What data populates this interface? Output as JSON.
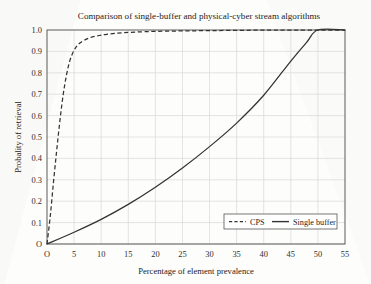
{
  "chart_data": {
    "type": "line",
    "title": "Comparison of single-buffer and physical-cyber stream algorithms",
    "xlabel": "Percentage of element prevalence",
    "ylabel": "Probality of retrieval",
    "xlim": [
      0,
      55
    ],
    "ylim": [
      0,
      1.0
    ],
    "grid": true,
    "legend_position": "lower right",
    "origin_label": "O",
    "xticks": [
      5,
      10,
      15,
      20,
      25,
      30,
      35,
      40,
      45,
      50,
      55
    ],
    "xticklabels": [
      "5",
      "10",
      "15",
      "20",
      "25",
      "30",
      "35",
      "40",
      "45",
      "50",
      "55"
    ],
    "yticks": [
      0.1,
      0.2,
      0.3,
      0.4,
      0.5,
      0.6,
      0.7,
      0.8,
      0.9,
      1.0
    ],
    "yticklabels": [
      "0.1",
      "0.2",
      "0.3",
      "0.4",
      "0.5",
      "0.6",
      "0.7",
      "0.8",
      "0.9",
      "1.0"
    ],
    "series": [
      {
        "name": "CPS",
        "style": "dashed",
        "color": "#333333",
        "x": [
          0,
          0.6,
          1.2,
          1.8,
          2.4,
          3.0,
          3.6,
          4.2,
          5.0,
          6.0,
          7.5,
          9.0,
          11.0,
          14.0,
          18.0,
          23.0,
          30.0,
          38.0,
          46.0,
          55.0
        ],
        "y": [
          0.0,
          0.13,
          0.29,
          0.44,
          0.58,
          0.7,
          0.79,
          0.855,
          0.905,
          0.938,
          0.96,
          0.971,
          0.98,
          0.987,
          0.992,
          0.995,
          0.997,
          0.999,
          0.999,
          1.0
        ]
      },
      {
        "name": "Single buffer",
        "style": "solid",
        "color": "#333333",
        "x": [
          0,
          5,
          10,
          15,
          20,
          25,
          30,
          35,
          40,
          45,
          48,
          50,
          55
        ],
        "y": [
          0.0,
          0.055,
          0.115,
          0.185,
          0.265,
          0.355,
          0.455,
          0.565,
          0.695,
          0.855,
          0.945,
          1.0,
          1.0
        ]
      }
    ],
    "legend": [
      {
        "label": "CPS",
        "style": "dashed"
      },
      {
        "label": "Single buffer",
        "style": "solid"
      }
    ]
  }
}
